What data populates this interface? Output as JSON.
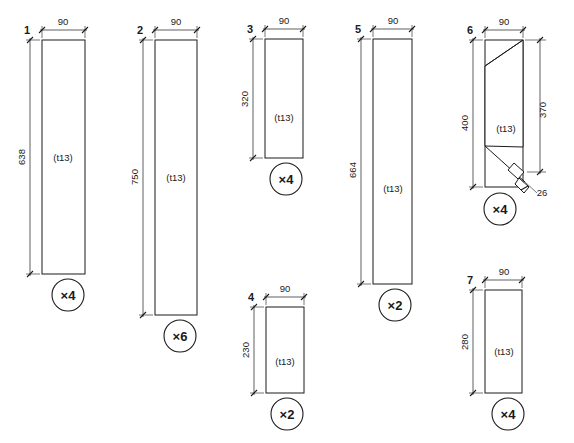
{
  "drawing": {
    "title": "Cut list part drawing",
    "units_note": "mm",
    "thickness_label": "(t13)",
    "colors": {
      "line": "#1a1a1a",
      "waste_fill": "#c9c9c9",
      "background": "#ffffff"
    }
  },
  "parts": [
    {
      "number": "1",
      "width_label": "90",
      "height_label": "638",
      "thickness_label": "(t13)",
      "quantity_label": "×4",
      "shape": "rectangle"
    },
    {
      "number": "2",
      "width_label": "90",
      "height_label": "750",
      "thickness_label": "(t13)",
      "quantity_label": "×6",
      "shape": "rectangle"
    },
    {
      "number": "3",
      "width_label": "90",
      "height_label": "320",
      "thickness_label": "(t13)",
      "quantity_label": "×4",
      "shape": "rectangle"
    },
    {
      "number": "4",
      "width_label": "90",
      "height_label": "230",
      "thickness_label": "(t13)",
      "quantity_label": "×2",
      "shape": "rectangle"
    },
    {
      "number": "5",
      "width_label": "90",
      "height_label": "664",
      "thickness_label": "(t13)",
      "quantity_label": "×2",
      "shape": "rectangle"
    },
    {
      "number": "6",
      "width_label": "90",
      "height_label": "400",
      "right_height_label": "370",
      "detail_label": "26",
      "thickness_label": "(t13)",
      "quantity_label": "×4",
      "shape": "angled-parallelogram"
    },
    {
      "number": "7",
      "width_label": "90",
      "height_label": "280",
      "thickness_label": "(t13)",
      "quantity_label": "×4",
      "shape": "rectangle"
    }
  ]
}
